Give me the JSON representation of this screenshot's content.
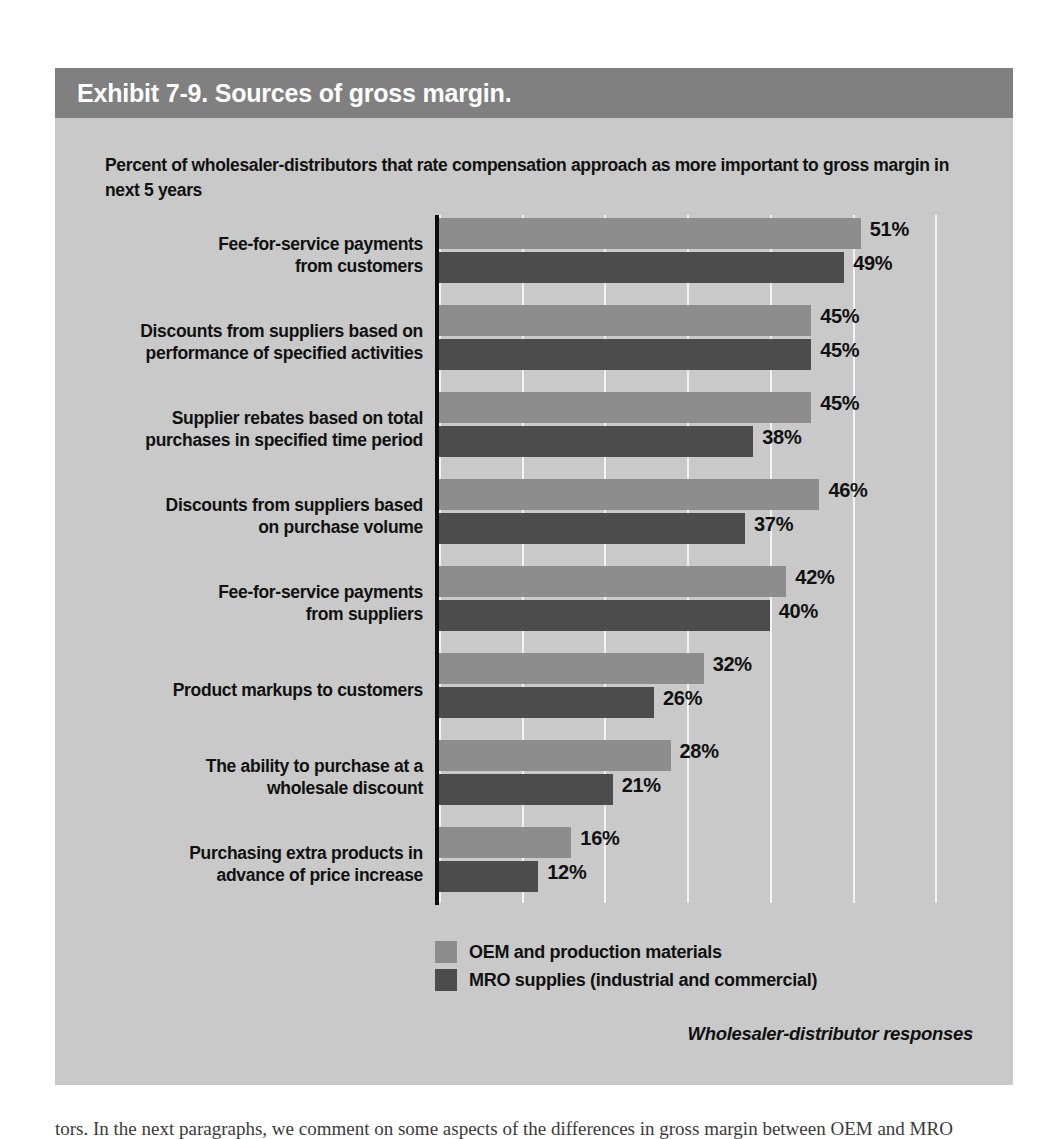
{
  "exhibit": {
    "title": "Exhibit 7-9. Sources of gross margin.",
    "subtitle": "Percent of wholesaler-distributors that rate compensation approach as more important to gross margin in next 5 years",
    "source_note": "Wholesaler-distributor responses",
    "page_text_fragment": "tors. In the next paragraphs, we comment on some aspects of the differences in gross margin between OEM and MRO"
  },
  "colors": {
    "header_bar": "#808080",
    "panel_background": "#c9c9c9",
    "series_0": "#8d8d8d",
    "series_1": "#4c4c4c",
    "gridline": "#f3f3f3",
    "axis": "#0d0d0d",
    "text": "#111111",
    "header_text": "#ffffff"
  },
  "chart_data": {
    "type": "bar",
    "orientation": "horizontal",
    "title": "Exhibit 7-9. Sources of gross margin.",
    "subtitle": "Percent of wholesaler-distributors that rate compensation approach as more important to gross margin in next 5 years",
    "xlabel": "",
    "ylabel": "",
    "xlim": [
      0,
      60
    ],
    "grid": true,
    "gridline_values": [
      0,
      10,
      20,
      30,
      40,
      50,
      60
    ],
    "value_suffix": "%",
    "legend_position": "bottom",
    "categories": [
      "Fee-for-service payments from customers",
      "Discounts from suppliers based on performance of specified activities",
      "Supplier rebates based on total purchases in specified time period",
      "Discounts from suppliers based on purchase volume",
      "Fee-for-service payments from suppliers",
      "Product markups to customers",
      "The ability to purchase at a wholesale discount",
      "Purchasing extra products in advance of price increase"
    ],
    "category_lines": [
      [
        "Fee-for-service payments",
        "from customers"
      ],
      [
        "Discounts from suppliers based on",
        "performance of specified activities"
      ],
      [
        "Supplier rebates based on total",
        "purchases in specified time period"
      ],
      [
        "Discounts from suppliers based",
        "on purchase volume"
      ],
      [
        "Fee-for-service payments",
        "from suppliers"
      ],
      [
        "Product markups to customers"
      ],
      [
        "The ability to purchase at a",
        "wholesale discount"
      ],
      [
        "Purchasing extra products in",
        "advance of price increase"
      ]
    ],
    "series": [
      {
        "name": "OEM and production materials",
        "color": "#8d8d8d",
        "values": [
          51,
          45,
          45,
          46,
          42,
          32,
          28,
          16
        ],
        "labels": [
          "51%",
          "45%",
          "45%",
          "46%",
          "42%",
          "32%",
          "28%",
          "16%"
        ]
      },
      {
        "name": "MRO supplies (industrial and commercial)",
        "color": "#4c4c4c",
        "values": [
          49,
          45,
          38,
          37,
          40,
          26,
          21,
          12
        ],
        "labels": [
          "49%",
          "45%",
          "38%",
          "37%",
          "40%",
          "26%",
          "21%",
          "12%"
        ]
      }
    ],
    "legend": [
      {
        "label": "OEM and production materials",
        "color": "#8d8d8d"
      },
      {
        "label": "MRO supplies (industrial and commercial)",
        "color": "#4c4c4c"
      }
    ]
  }
}
